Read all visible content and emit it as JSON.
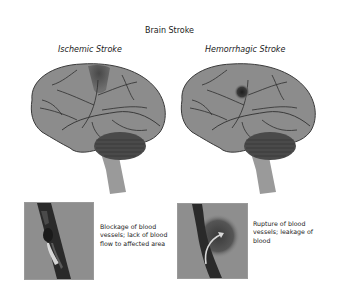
{
  "title": "Brain Stroke",
  "panels": [
    {
      "heading": "Ischemic Stroke",
      "description": "Blockage of blood vessels; lack of blood flow to affected area",
      "lesion": "dark-shaded-region-top"
    },
    {
      "heading": "Hemorrhagic Stroke",
      "description": "Rupture of blood vessels; leakage of blood",
      "lesion": "dark-spot-bleed"
    }
  ],
  "colors": {
    "brain": "#8c8c8c",
    "vessels": "#2e2e2e",
    "cerebellum": "#4a4a4a",
    "box_bg": "#8e8e8e",
    "text": "#222222"
  }
}
